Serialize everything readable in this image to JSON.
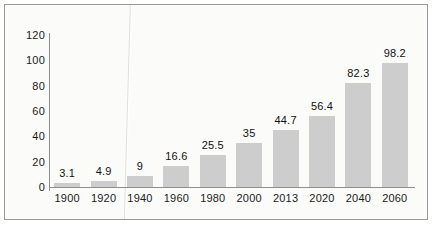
{
  "chart_data": {
    "type": "bar",
    "title": "",
    "subtitle": "",
    "xlabel": "",
    "ylabel": "",
    "categories": [
      "1900",
      "1920",
      "1940",
      "1960",
      "1980",
      "2000",
      "2013",
      "2020",
      "2040",
      "2060"
    ],
    "values": [
      3.1,
      4.9,
      9,
      16.6,
      25.5,
      35,
      44.7,
      56.4,
      82.3,
      98.2
    ],
    "value_labels": [
      "3.1",
      "4.9",
      "9",
      "16.6",
      "25.5",
      "35",
      "44.7",
      "56.4",
      "82.3",
      "98.2"
    ],
    "ylim": [
      0,
      120
    ],
    "ytick_labels": [
      "0",
      "20",
      "40",
      "60",
      "80",
      "100",
      "120"
    ],
    "yticks": [
      0,
      20,
      40,
      60,
      80,
      100,
      120
    ],
    "grid": false,
    "legend": false,
    "legend_position": "none",
    "bar_color": "#cdcdcd",
    "axis_color": "#8e8e8e",
    "text_color": "#1a1a1a",
    "background_color": "#fbfbfa",
    "frame_color": "#9a9a9a"
  }
}
